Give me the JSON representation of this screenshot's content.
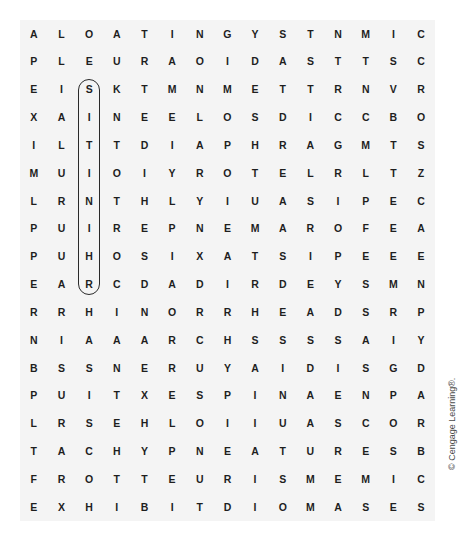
{
  "puzzle": {
    "type": "word-search",
    "rows": 19,
    "cols": 15,
    "grid": [
      [
        "A",
        "L",
        "O",
        "A",
        "T",
        "I",
        "N",
        "G",
        "Y",
        "S",
        "T",
        "N",
        "M",
        "I",
        "C"
      ],
      [
        "P",
        "L",
        "E",
        "U",
        "R",
        "A",
        "O",
        "I",
        "D",
        "A",
        "S",
        "T",
        "T",
        "S",
        "C"
      ],
      [
        "E",
        "I",
        "S",
        "K",
        "T",
        "M",
        "N",
        "M",
        "E",
        "T",
        "T",
        "R",
        "N",
        "V",
        "R"
      ],
      [
        "X",
        "A",
        "I",
        "N",
        "E",
        "E",
        "L",
        "O",
        "S",
        "D",
        "I",
        "C",
        "C",
        "B",
        "O"
      ],
      [
        "I",
        "L",
        "T",
        "T",
        "D",
        "I",
        "A",
        "P",
        "H",
        "R",
        "A",
        "G",
        "M",
        "T",
        "S"
      ],
      [
        "M",
        "U",
        "I",
        "O",
        "I",
        "Y",
        "R",
        "O",
        "T",
        "E",
        "L",
        "R",
        "L",
        "T",
        "Z"
      ],
      [
        "L",
        "R",
        "N",
        "T",
        "H",
        "L",
        "Y",
        "I",
        "U",
        "A",
        "S",
        "I",
        "P",
        "E",
        "C"
      ],
      [
        "P",
        "U",
        "I",
        "R",
        "E",
        "P",
        "N",
        "E",
        "M",
        "A",
        "R",
        "O",
        "F",
        "E",
        "A"
      ],
      [
        "P",
        "U",
        "H",
        "O",
        "S",
        "I",
        "X",
        "A",
        "T",
        "S",
        "I",
        "P",
        "E",
        "E",
        "E"
      ],
      [
        "E",
        "A",
        "R",
        "C",
        "D",
        "A",
        "D",
        "I",
        "R",
        "D",
        "E",
        "Y",
        "S",
        "M",
        "N"
      ],
      [
        "R",
        "R",
        "H",
        "I",
        "N",
        "O",
        "R",
        "R",
        "H",
        "E",
        "A",
        "D",
        "S",
        "R",
        "P"
      ],
      [
        "N",
        "I",
        "A",
        "A",
        "A",
        "R",
        "C",
        "H",
        "S",
        "S",
        "S",
        "S",
        "A",
        "I",
        "Y"
      ],
      [
        "B",
        "S",
        "S",
        "N",
        "E",
        "R",
        "U",
        "Y",
        "A",
        "I",
        "D",
        "I",
        "S",
        "G",
        "D"
      ],
      [
        "P",
        "U",
        "I",
        "T",
        "X",
        "E",
        "S",
        "P",
        "I",
        "N",
        "A",
        "E",
        "N",
        "P",
        "A"
      ],
      [
        "L",
        "R",
        "S",
        "E",
        "H",
        "L",
        "O",
        "I",
        "I",
        "U",
        "A",
        "S",
        "C",
        "O",
        "R"
      ],
      [
        "T",
        "A",
        "C",
        "H",
        "Y",
        "P",
        "N",
        "E",
        "A",
        "T",
        "U",
        "R",
        "E",
        "S",
        "B"
      ],
      [
        "F",
        "R",
        "O",
        "T",
        "T",
        "E",
        "U",
        "R",
        "I",
        "S",
        "M",
        "E",
        "M",
        "I",
        "C"
      ],
      [
        "E",
        "X",
        "H",
        "I",
        "B",
        "I",
        "T",
        "D",
        "I",
        "O",
        "M",
        "A",
        "S",
        "E",
        "S"
      ]
    ],
    "found_words": [
      {
        "word": "SITTINIHR",
        "direction": "vertical",
        "column": 2,
        "start_row": 2,
        "end_row": 9
      }
    ]
  },
  "credit": "© Cengage Learning®.",
  "colors": {
    "panel_background": "#f4f4f4",
    "letter": "#1e1e1e",
    "circle_stroke": "#2a2a2a"
  }
}
